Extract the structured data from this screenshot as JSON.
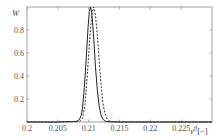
{
  "chart_data": {
    "type": "line",
    "title": "",
    "xlabel": "ν^{ff} [−]",
    "ylabel": "W",
    "xlim": [
      0.2,
      0.23
    ],
    "ylim": [
      0,
      1
    ],
    "grid": false,
    "legend": null,
    "x_ticks": [
      "0.2",
      "0.205",
      "0.21",
      "0.215",
      "0.22",
      "0.225"
    ],
    "y_ticks": [
      "0.2",
      "0.4",
      "0.6",
      "0.8"
    ],
    "series": [
      {
        "name": "solid",
        "style": "solid",
        "color": "#222222",
        "x": [
          0.2,
          0.205,
          0.208,
          0.2085,
          0.2088,
          0.209,
          0.2093,
          0.2096,
          0.2099,
          0.2101,
          0.2103,
          0.2105,
          0.2107,
          0.2109,
          0.2111,
          0.2114,
          0.2117,
          0.212,
          0.2123,
          0.2126,
          0.213,
          0.215,
          0.23
        ],
        "y": [
          0,
          0,
          0.005,
          0.02,
          0.06,
          0.12,
          0.3,
          0.55,
          0.82,
          0.96,
          1.0,
          0.95,
          0.82,
          0.66,
          0.48,
          0.28,
          0.14,
          0.06,
          0.025,
          0.01,
          0.003,
          0,
          0
        ]
      },
      {
        "name": "dashed",
        "style": "dashed",
        "color": "#333333",
        "x": [
          0.2,
          0.205,
          0.2085,
          0.209,
          0.2094,
          0.2098,
          0.2102,
          0.2105,
          0.2108,
          0.2111,
          0.2114,
          0.2117,
          0.212,
          0.2123,
          0.2126,
          0.213,
          0.2135,
          0.215,
          0.23
        ],
        "y": [
          0,
          0,
          0.005,
          0.03,
          0.15,
          0.42,
          0.75,
          0.93,
          1.0,
          0.93,
          0.76,
          0.54,
          0.33,
          0.17,
          0.08,
          0.025,
          0.005,
          0,
          0
        ]
      }
    ]
  },
  "axes": {
    "y_title": "W",
    "x_title_main": "ν",
    "x_title_sup": "ff",
    "x_title_unit": "[−]"
  }
}
